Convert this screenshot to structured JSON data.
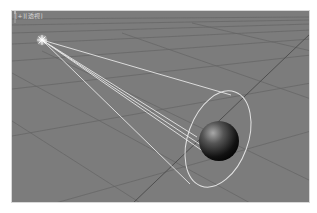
{
  "viewport": {
    "label": "[+][透视]",
    "background": "#7c7c7c",
    "grid_color": "#5e5e5e",
    "beam_color": "#e6e6e6"
  },
  "scene": {
    "light": {
      "type": "spotlight",
      "x": 30,
      "y": 29
    },
    "beam_targets": [
      [
        219,
        84
      ],
      [
        185,
        126
      ],
      [
        192,
        136
      ],
      [
        198,
        145
      ],
      [
        178,
        173
      ]
    ],
    "cone_ellipse": {
      "cx": 206,
      "cy": 128,
      "rx": 30,
      "ry": 50,
      "rotate": 20
    },
    "sphere": {
      "cx": 207,
      "cy": 130,
      "r": 20
    }
  },
  "icons": {
    "light": "spotlight-icon",
    "gizmo": "axis-gizmo-icon"
  }
}
